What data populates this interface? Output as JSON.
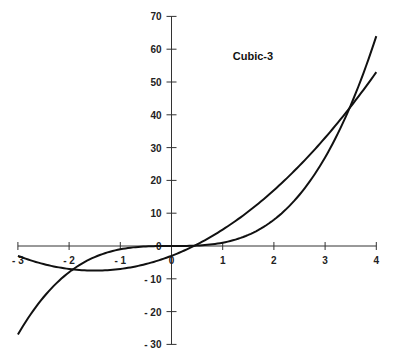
{
  "chart_data": {
    "type": "line",
    "title": "Cubic-3",
    "xlabel": "",
    "ylabel": "",
    "xlim": [
      -3,
      4
    ],
    "ylim": [
      -30,
      70
    ],
    "x_ticks": [
      -3,
      -2,
      -1,
      0,
      1,
      2,
      3,
      4
    ],
    "y_ticks": [
      -30,
      -20,
      -10,
      0,
      10,
      20,
      30,
      40,
      50,
      60,
      70
    ],
    "grid": false,
    "legend": null,
    "series": [
      {
        "name": "y = x^3",
        "x": [
          -3,
          -2.5,
          -2,
          -1.5,
          -1,
          -0.5,
          0,
          0.5,
          1,
          1.5,
          2,
          2.5,
          3,
          3.5,
          4
        ],
        "values": [
          -27,
          -15.6,
          -8,
          -3.4,
          -1,
          -0.1,
          0,
          0.1,
          1,
          3.4,
          8,
          15.6,
          27,
          42.9,
          64
        ]
      },
      {
        "name": "y = 2x^2 + 6x - 3",
        "x": [
          -3,
          -2.5,
          -2,
          -1.5,
          -1,
          -0.5,
          0,
          0.5,
          1,
          1.5,
          2,
          2.5,
          3,
          3.5,
          4
        ],
        "values": [
          -3,
          -5.5,
          -7,
          -7.5,
          -7,
          -5.5,
          -3,
          0.5,
          5,
          10.5,
          17,
          24.5,
          33,
          42.5,
          53
        ]
      }
    ],
    "annotations": [
      {
        "text": "Cubic-3",
        "x": 1.1,
        "y": 58
      }
    ]
  }
}
